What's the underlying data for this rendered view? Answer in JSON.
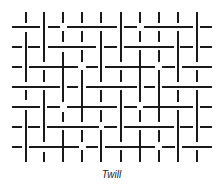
{
  "caption": "Twill",
  "stroke_color": "#1a1a1a",
  "stroke_width": 2,
  "weave": {
    "type": "twill",
    "rows_y": [
      27,
      47,
      67,
      87,
      107,
      127,
      147
    ],
    "cols_x": [
      26,
      44,
      63,
      82,
      101,
      121,
      140,
      159,
      178,
      197
    ],
    "horizontal_segments": [
      [
        [
          12,
          40
        ],
        [
          48,
          60
        ],
        [
          67,
          117
        ],
        [
          124,
          137
        ],
        [
          144,
          193
        ],
        [
          200,
          212
        ]
      ],
      [
        [
          12,
          22
        ],
        [
          28,
          40
        ],
        [
          48,
          96
        ],
        [
          104,
          117
        ],
        [
          124,
          174
        ],
        [
          180,
          193
        ],
        [
          200,
          212
        ]
      ],
      [
        [
          12,
          22
        ],
        [
          29,
          78
        ],
        [
          86,
          98
        ],
        [
          105,
          155
        ],
        [
          162,
          175
        ],
        [
          182,
          212
        ]
      ],
      [
        [
          12,
          60
        ],
        [
          67,
          78
        ],
        [
          86,
          137
        ],
        [
          144,
          155
        ],
        [
          162,
          212
        ]
      ],
      [
        [
          12,
          40
        ],
        [
          47,
          60
        ],
        [
          67,
          117
        ],
        [
          124,
          137
        ],
        [
          143,
          193
        ],
        [
          200,
          212
        ]
      ],
      [
        [
          12,
          22
        ],
        [
          28,
          40
        ],
        [
          47,
          99
        ],
        [
          104,
          117
        ],
        [
          124,
          174
        ],
        [
          180,
          193
        ],
        [
          200,
          212
        ]
      ],
      [
        [
          12,
          22
        ],
        [
          29,
          79
        ],
        [
          86,
          98
        ],
        [
          105,
          155
        ],
        [
          162,
          175
        ],
        [
          182,
          212
        ]
      ]
    ],
    "vertical_segments": [
      [
        [
          12,
          23
        ],
        [
          32,
          82
        ],
        [
          90,
          100
        ],
        [
          110,
          162
        ]
      ],
      [
        [
          12,
          62
        ],
        [
          70,
          82
        ],
        [
          90,
          142
        ],
        [
          152,
          162
        ]
      ],
      [
        [
          12,
          23
        ],
        [
          31,
          42
        ],
        [
          52,
          102
        ],
        [
          112,
          122
        ],
        [
          130,
          162
        ]
      ],
      [
        [
          12,
          23
        ],
        [
          31,
          42
        ],
        [
          50,
          62
        ],
        [
          70,
          122
        ],
        [
          130,
          142
        ],
        [
          150,
          162
        ]
      ],
      [
        [
          12,
          23
        ],
        [
          31,
          82
        ],
        [
          90,
          102
        ],
        [
          110,
          122
        ],
        [
          130,
          162
        ]
      ],
      [
        [
          12,
          62
        ],
        [
          70,
          82
        ],
        [
          90,
          142
        ],
        [
          150,
          162
        ]
      ],
      [
        [
          12,
          23
        ],
        [
          31,
          42
        ],
        [
          50,
          102
        ],
        [
          110,
          122
        ],
        [
          130,
          162
        ]
      ],
      [
        [
          12,
          23
        ],
        [
          31,
          42
        ],
        [
          50,
          62
        ],
        [
          70,
          122
        ],
        [
          130,
          142
        ],
        [
          150,
          162
        ]
      ],
      [
        [
          12,
          23
        ],
        [
          31,
          82
        ],
        [
          90,
          102
        ],
        [
          110,
          162
        ]
      ],
      [
        [
          12,
          62
        ],
        [
          70,
          82
        ],
        [
          90,
          142
        ],
        [
          150,
          162
        ]
      ]
    ]
  }
}
